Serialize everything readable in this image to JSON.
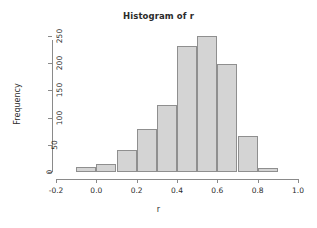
{
  "chart_data": {
    "type": "bar",
    "title": "Histogram of r",
    "xlabel": "r",
    "ylabel": "Frequency",
    "categories": [
      "-0.1 to 0.0",
      "0.0 to 0.1",
      "0.1 to 0.2",
      "0.2 to 0.3",
      "0.3 to 0.4",
      "0.4 to 0.5",
      "0.5 to 0.6",
      "0.6 to 0.7",
      "0.7 to 0.8",
      "0.8 to 0.9"
    ],
    "bin_edges": [
      -0.1,
      0.0,
      0.1,
      0.2,
      0.3,
      0.4,
      0.5,
      0.6,
      0.7,
      0.8,
      0.9
    ],
    "values": [
      9,
      14,
      41,
      79,
      123,
      231,
      250,
      199,
      66,
      8
    ],
    "bin_width": 0.1,
    "xlim": [
      -0.2,
      1.0
    ],
    "ylim": [
      0,
      250
    ],
    "x_ticks": [
      -0.2,
      0.0,
      0.2,
      0.4,
      0.6,
      0.8,
      1.0
    ],
    "x_tick_labels": [
      "-0.2",
      "0.0",
      "0.2",
      "0.4",
      "0.6",
      "0.8",
      "1.0"
    ],
    "y_ticks": [
      0,
      50,
      100,
      150,
      200,
      250
    ],
    "y_tick_labels": [
      "0",
      "50",
      "100",
      "150",
      "200",
      "250"
    ],
    "grid": false,
    "legend": "none",
    "bar_fill_color": "#d4d4d4",
    "bar_border_color": "#8f8f8f",
    "axis_color": "#8a8a8a",
    "text_color": "#2b2b2b",
    "background_color": "#ffffff"
  }
}
